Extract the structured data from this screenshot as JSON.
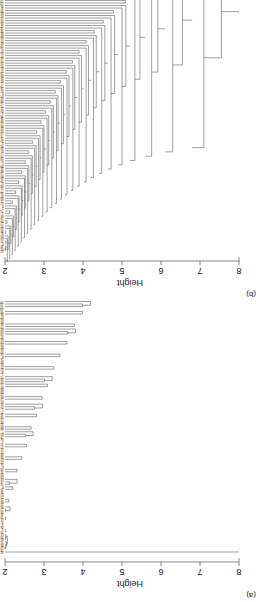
{
  "figure": {
    "caption_a": "(a)",
    "caption_b": "(b)",
    "orientation": "rotated-180",
    "background": "#ffffff",
    "line_color": "#2b2b2b",
    "axis_color": "#6b6b6b"
  },
  "panels": [
    {
      "id": "b",
      "tag": "(b)",
      "axis_label": "Height",
      "ticks": [
        "8",
        "7",
        "6",
        "5",
        "4",
        "3",
        "2"
      ]
    },
    {
      "id": "a",
      "tag": "(a)",
      "axis_label": "Height",
      "ticks": [
        "8",
        "7",
        "6",
        "5",
        "4",
        "3",
        "2"
      ]
    }
  ],
  "chart_data": [
    {
      "type": "dendrogram",
      "panel": "a",
      "title": "(a)",
      "xlabel": "",
      "ylabel": "Height",
      "ylim": [
        2,
        8
      ],
      "ticks": [
        8,
        7,
        6,
        5,
        4,
        3,
        2
      ],
      "grid": false,
      "legend": "none",
      "n_leaves": 100,
      "description": "Hierarchical clustering dendrogram. One outlier leaf splits off at height ~8.0; the remaining mass of leaves fuses between heights ~5.6 and ~2.0, producing a broad fan of many short terminal branches.",
      "root_height": 8.0,
      "merge_heights": [
        8.0,
        5.62,
        5.45,
        5.3,
        5.18,
        5.05,
        4.95,
        4.86,
        4.78,
        4.7,
        4.62,
        4.55,
        4.48,
        4.41,
        4.35,
        4.29,
        4.23,
        4.17,
        4.12,
        4.06,
        4.01,
        3.96,
        3.91,
        3.86,
        3.81,
        3.77,
        3.72,
        3.68,
        3.63,
        3.59,
        3.55,
        3.51,
        3.47,
        3.43,
        3.39,
        3.35,
        3.31,
        3.27,
        3.24,
        3.2,
        3.16,
        3.13,
        3.09,
        3.06,
        3.02,
        2.99,
        2.95,
        2.92,
        2.89,
        2.85,
        2.82,
        2.79,
        2.76,
        2.73,
        2.7,
        2.67,
        2.64,
        2.61,
        2.58,
        2.55,
        2.52,
        2.49,
        2.46,
        2.44,
        2.41,
        2.38,
        2.35,
        2.33,
        2.3,
        2.28,
        2.25,
        2.23,
        2.2,
        2.18,
        2.15,
        2.13,
        2.11,
        2.08,
        2.06,
        2.04,
        2.02,
        2.0
      ],
      "leaf_labels": [
        "82",
        "18",
        "42",
        "84",
        "91",
        "80",
        "33",
        "57",
        "29",
        "4",
        "46",
        "9",
        "41",
        "61",
        "13",
        "48",
        "45",
        "17",
        "68",
        "72",
        "86",
        "20",
        "25",
        "50",
        "36",
        "40",
        "5",
        "74",
        "12",
        "63",
        "16",
        "59",
        "31",
        "78",
        "6",
        "55",
        "22",
        "67",
        "38",
        "88",
        "11",
        "51",
        "27",
        "70",
        "3",
        "64",
        "19",
        "83",
        "7",
        "44",
        "60",
        "32",
        "92",
        "15",
        "54",
        "26",
        "77",
        "2",
        "49",
        "35",
        "81",
        "10",
        "66",
        "23",
        "58",
        "39",
        "90",
        "14",
        "52",
        "28",
        "71",
        "1",
        "47",
        "62",
        "21",
        "85",
        "34",
        "76",
        "8",
        "56",
        "30",
        "69",
        "43",
        "93",
        "24",
        "65",
        "37",
        "79",
        "53",
        "87",
        "73",
        "94",
        "95",
        "96",
        "97",
        "98",
        "99",
        "100",
        "101",
        "102"
      ]
    },
    {
      "type": "dendrogram",
      "panel": "b",
      "title": "(b)",
      "xlabel": "",
      "ylabel": "Height",
      "ylim": [
        2,
        8
      ],
      "ticks": [
        8,
        7,
        6,
        5,
        4,
        3,
        2
      ],
      "grid": false,
      "legend": "none",
      "n_leaves": 100,
      "description": "Hierarchical clustering dendrogram with a chaining / staircase topology: a long nested ladder of sequential merges descending from height ~8.0 through ~2.0, each step attaching a single leaf or tiny cluster.",
      "root_height": 8.0,
      "merge_heights": [
        8.0,
        7.55,
        7.1,
        6.8,
        6.55,
        6.3,
        6.1,
        5.92,
        5.76,
        5.6,
        5.46,
        5.33,
        5.21,
        5.1,
        5.0,
        4.9,
        4.81,
        4.72,
        4.64,
        4.56,
        4.48,
        4.41,
        4.34,
        4.27,
        4.2,
        4.14,
        4.08,
        4.02,
        3.96,
        3.9,
        3.85,
        3.79,
        3.74,
        3.69,
        3.64,
        3.59,
        3.54,
        3.5,
        3.45,
        3.41,
        3.36,
        3.32,
        3.28,
        3.24,
        3.2,
        3.16,
        3.12,
        3.08,
        3.04,
        3.0,
        2.97,
        2.93,
        2.9,
        2.86,
        2.83,
        2.8,
        2.76,
        2.73,
        2.7,
        2.67,
        2.64,
        2.61,
        2.58,
        2.55,
        2.52,
        2.5,
        2.47,
        2.44,
        2.42,
        2.39,
        2.36,
        2.34,
        2.31,
        2.29,
        2.26,
        2.24,
        2.22,
        2.19,
        2.17,
        2.15,
        2.12,
        2.1,
        2.08,
        2.06,
        2.04,
        2.02,
        2.0
      ],
      "leaf_labels": [
        "21",
        "45",
        "39",
        "8",
        "30",
        "69",
        "60",
        "31",
        "96",
        "94",
        "91",
        "12",
        "99",
        "19",
        "64",
        "1",
        "73",
        "2",
        "6",
        "57",
        "24",
        "88",
        "47",
        "34",
        "77",
        "15",
        "68",
        "5",
        "59",
        "26",
        "80",
        "13",
        "66",
        "36",
        "89",
        "7",
        "51",
        "28",
        "70",
        "17",
        "61",
        "43",
        "92",
        "3",
        "54",
        "25",
        "75",
        "10",
        "63",
        "32",
        "84",
        "14",
        "56",
        "38",
        "90",
        "4",
        "49",
        "22",
        "71",
        "16",
        "58",
        "41",
        "87",
        "9",
        "52",
        "29",
        "79",
        "11",
        "62",
        "35",
        "86",
        "18",
        "67",
        "40",
        "93",
        "23",
        "74",
        "44",
        "97",
        "50",
        "27",
        "76",
        "53",
        "82",
        "20",
        "65",
        "48",
        "85",
        "33",
        "78",
        "42",
        "95",
        "55",
        "72",
        "81",
        "83",
        "98",
        "37",
        "46",
        "100"
      ]
    }
  ]
}
